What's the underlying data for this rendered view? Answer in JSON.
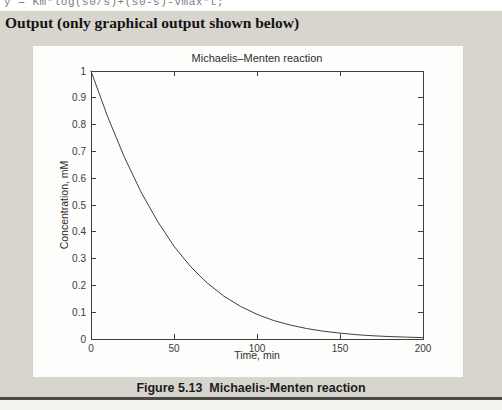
{
  "code_line": "y = Km*log(s0/s)+(s0-s)-vmax*t;",
  "output_heading": "Output (only graphical output shown below)",
  "caption": "Figure 5.13  Michaelis-Menten reaction",
  "colors": {
    "band_bg": "#d8d5cf",
    "figure_bg": "#fdfdfb",
    "bottom_rule": "#4a4a47",
    "plot_line": "#3f3f3f",
    "axis_line": "#3f3f3f"
  },
  "chart_data": {
    "type": "line",
    "title": "Michaelis–Menten reaction",
    "xlabel": "Time, min",
    "ylabel": "Concentration, mM",
    "xlim": [
      0,
      200
    ],
    "ylim": [
      0,
      1
    ],
    "grid": false,
    "box": true,
    "legend": "none",
    "x_ticks": {
      "values": [
        0,
        50,
        100,
        150,
        200
      ],
      "labels": [
        "0",
        "50",
        "100",
        "150",
        "200"
      ]
    },
    "y_ticks": {
      "values": [
        0,
        0.1,
        0.2,
        0.3,
        0.4,
        0.5,
        0.6,
        0.7,
        0.8,
        0.9,
        1
      ],
      "labels": [
        "0",
        "0.1",
        "0.2",
        "0.3",
        "0.4",
        "0.5",
        "0.6",
        "0.7",
        "0.8",
        "0.9",
        "1"
      ]
    },
    "series": [
      {
        "name": "substrate concentration",
        "x": [
          0,
          10,
          20,
          30,
          40,
          50,
          60,
          70,
          80,
          90,
          100,
          110,
          120,
          130,
          140,
          150,
          160,
          170,
          180,
          190,
          200
        ],
        "y": [
          1.0,
          0.83,
          0.68,
          0.55,
          0.44,
          0.346,
          0.27,
          0.209,
          0.16,
          0.122,
          0.092,
          0.069,
          0.052,
          0.039,
          0.029,
          0.022,
          0.016,
          0.012,
          0.009,
          0.007,
          0.005
        ]
      }
    ]
  }
}
